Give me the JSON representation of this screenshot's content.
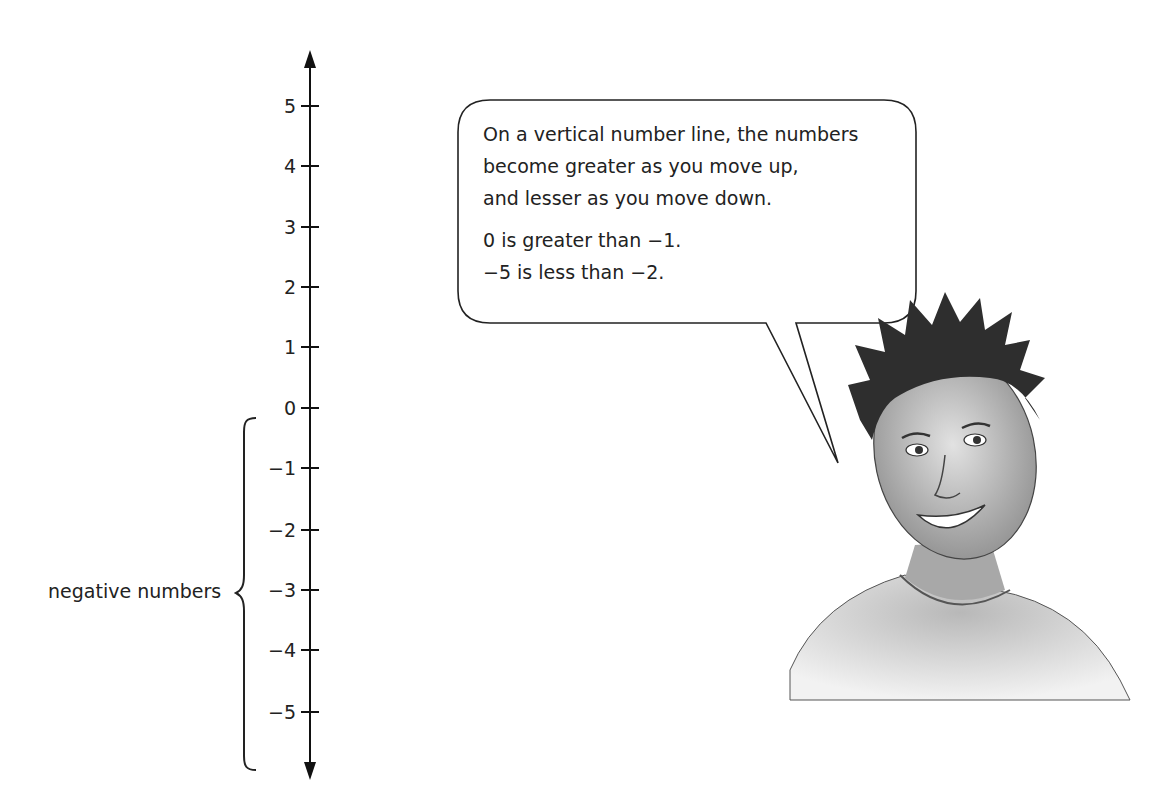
{
  "number_line": {
    "orientation": "vertical",
    "ticks": [
      "5",
      "4",
      "3",
      "2",
      "1",
      "0",
      "−1",
      "−2",
      "−3",
      "−4",
      "−5"
    ],
    "tick_values": [
      5,
      4,
      3,
      2,
      1,
      0,
      -1,
      -2,
      -3,
      -4,
      -5
    ],
    "arrows": [
      "up",
      "down"
    ]
  },
  "bracket": {
    "label": "negative numbers",
    "spans_from": "below 0",
    "spans_to": "below −5"
  },
  "speech_bubble": {
    "lines": [
      "On a vertical number line, the numbers",
      "become greater as you move up,",
      "and lesser as you move down."
    ],
    "examples": [
      "0 is greater than −1.",
      "−5 is less than −2."
    ]
  },
  "illustration": {
    "subject": "smiling boy with spiky hair, pencil drawing"
  }
}
